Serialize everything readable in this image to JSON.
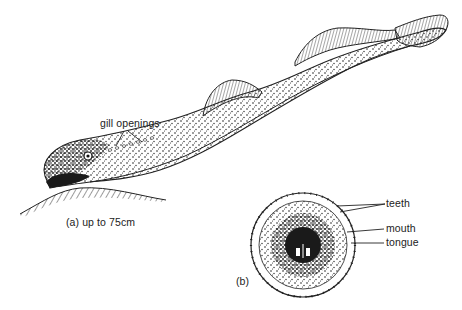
{
  "figure": {
    "panel_a": {
      "caption": "(a) up to 75cm",
      "labels": {
        "gill_openings": "gill openings"
      }
    },
    "panel_b": {
      "caption": "(b)",
      "labels": {
        "teeth": "teeth",
        "mouth": "mouth",
        "tongue": "tongue"
      }
    }
  },
  "colors": {
    "ink": "#1a1a1a",
    "background": "#ffffff"
  }
}
